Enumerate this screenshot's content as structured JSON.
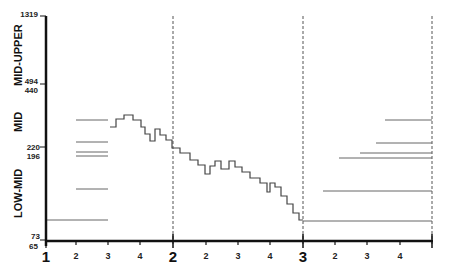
{
  "chart_data": {
    "type": "line",
    "title": "",
    "xlabel": "",
    "ylabel": "",
    "y_zones": [
      "LOW-MID",
      "MID",
      "MID-UPPER"
    ],
    "y_ticks": [
      65,
      73,
      196,
      220,
      440,
      494,
      1319
    ],
    "x_major_ticks": [
      "1",
      "2",
      "3"
    ],
    "x_minor_ticks": [
      "2",
      "3",
      "4",
      "2",
      "3",
      "4",
      "2",
      "3",
      "4"
    ],
    "grid": "dashed vertical lines at major ticks",
    "series": [
      {
        "name": "step-line",
        "style": "step",
        "points_px": [
          [
            110,
            127
          ],
          [
            116,
            127
          ],
          [
            116,
            119
          ],
          [
            124,
            119
          ],
          [
            124,
            115
          ],
          [
            133,
            115
          ],
          [
            133,
            120
          ],
          [
            141,
            120
          ],
          [
            141,
            127
          ],
          [
            145,
            127
          ],
          [
            145,
            134
          ],
          [
            150,
            134
          ],
          [
            150,
            141
          ],
          [
            155,
            141
          ],
          [
            155,
            129
          ],
          [
            160,
            129
          ],
          [
            160,
            135
          ],
          [
            166,
            135
          ],
          [
            166,
            140
          ],
          [
            172,
            140
          ],
          [
            172,
            148
          ],
          [
            180,
            148
          ],
          [
            180,
            153
          ],
          [
            190,
            153
          ],
          [
            190,
            160
          ],
          [
            198,
            160
          ],
          [
            198,
            165
          ],
          [
            205,
            165
          ],
          [
            205,
            174
          ],
          [
            210,
            174
          ],
          [
            210,
            166
          ],
          [
            215,
            166
          ],
          [
            215,
            161
          ],
          [
            221,
            161
          ],
          [
            221,
            169
          ],
          [
            229,
            169
          ],
          [
            229,
            161
          ],
          [
            235,
            161
          ],
          [
            235,
            167
          ],
          [
            242,
            167
          ],
          [
            242,
            172
          ],
          [
            250,
            172
          ],
          [
            250,
            178
          ],
          [
            260,
            178
          ],
          [
            260,
            183
          ],
          [
            267,
            183
          ],
          [
            267,
            192
          ],
          [
            270,
            192
          ],
          [
            270,
            183
          ],
          [
            275,
            183
          ],
          [
            275,
            187
          ],
          [
            281,
            187
          ],
          [
            281,
            196
          ],
          [
            287,
            196
          ],
          [
            287,
            204
          ],
          [
            293,
            204
          ],
          [
            293,
            213
          ],
          [
            299,
            213
          ],
          [
            299,
            220
          ],
          [
            303,
            220
          ]
        ]
      }
    ],
    "left_reference_lines": [
      {
        "y_px": 120,
        "x_from": 76,
        "x_to": 108
      },
      {
        "y_px": 142,
        "x_from": 76,
        "x_to": 108
      },
      {
        "y_px": 152,
        "x_from": 76,
        "x_to": 108
      },
      {
        "y_px": 156,
        "x_from": 76,
        "x_to": 108
      },
      {
        "y_px": 189,
        "x_from": 76,
        "x_to": 108
      },
      {
        "y_px": 220,
        "x_from": 46,
        "x_to": 108
      }
    ],
    "right_reference_lines": [
      {
        "y_px": 120,
        "x_from": 385,
        "x_to": 432
      },
      {
        "y_px": 143,
        "x_from": 376,
        "x_to": 432
      },
      {
        "y_px": 153,
        "x_from": 360,
        "x_to": 432
      },
      {
        "y_px": 158,
        "x_from": 339,
        "x_to": 432
      },
      {
        "y_px": 191,
        "x_from": 323,
        "x_to": 432
      },
      {
        "y_px": 221,
        "x_from": 303,
        "x_to": 432
      }
    ]
  },
  "labels": {
    "zone_upper": "MID-UPPER",
    "zone_mid": "MID",
    "zone_low": "LOW-MID",
    "y1319": "1319",
    "y494": "494",
    "y440": "440",
    "y220": "220",
    "y196": "196",
    "y73": "73",
    "y65": "65",
    "x_major_1": "1",
    "x_major_2": "2",
    "x_major_3": "3",
    "x_minor": [
      "2",
      "3",
      "4",
      "2",
      "3",
      "4",
      "2",
      "3",
      "4"
    ]
  },
  "colors": {
    "axis": "#111111",
    "series": "#444444",
    "reference": "#666666",
    "grid": "#555555"
  }
}
